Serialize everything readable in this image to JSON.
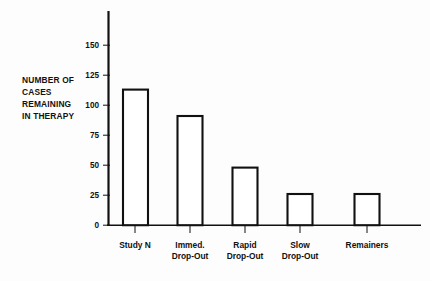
{
  "chart_data": {
    "type": "bar",
    "title": "",
    "subtitle": "",
    "xlabel": "",
    "ylabel": "NUMBER OF CASES REMAINING IN THERAPY",
    "ylabel_lines": [
      "NUMBER OF",
      "CASES",
      "REMAINING",
      "IN THERAPY"
    ],
    "categories": [
      "Study N",
      "Immed. Drop-Out",
      "Rapid Drop-Out",
      "Slow Drop-Out",
      "Remainers"
    ],
    "category_lines": [
      [
        "Study N"
      ],
      [
        "Immed.",
        "Drop-Out"
      ],
      [
        "Rapid",
        "Drop-Out"
      ],
      [
        "Slow",
        "Drop-Out"
      ],
      [
        "Remainers"
      ]
    ],
    "values": [
      145,
      113,
      91,
      48,
      26
    ],
    "ylim": [
      0,
      168
    ],
    "yticks": [
      0,
      25,
      50,
      75,
      100,
      125,
      150
    ],
    "ytick_labels": [
      "0",
      "25",
      "50",
      "75",
      "100",
      "125",
      "150"
    ],
    "grid": false,
    "legend": null,
    "bar_fill": "#ffffff",
    "bar_stroke": "#111111",
    "axis_color": "#111111",
    "background": "#fdfdfd"
  }
}
